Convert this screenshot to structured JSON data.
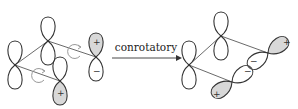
{
  "figure": {
    "reaction_label": "conrotatory",
    "signs": {
      "plus": "+",
      "minus": "−"
    },
    "left_panel": {
      "description": "reactant p-orbitals with rotation arrows"
    },
    "right_panel": {
      "description": "product p-orbitals after conrotatory twist"
    }
  }
}
